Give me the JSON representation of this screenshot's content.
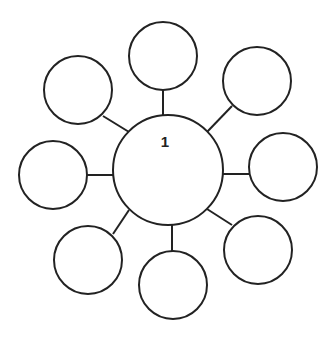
{
  "diagram": {
    "type": "bubble-map",
    "stroke_color": "#222222",
    "background": "#ffffff",
    "center_node": {
      "label": "1",
      "cx": 168,
      "cy": 170,
      "r": 55,
      "label_x": 165,
      "label_y": 147
    },
    "outer_nodes": [
      {
        "id": "top",
        "label": "",
        "cx": 163,
        "cy": 56,
        "r": 34,
        "line": [
          163,
          90,
          163,
          115
        ]
      },
      {
        "id": "top-right",
        "label": "",
        "cx": 257,
        "cy": 81,
        "r": 34,
        "line": [
          232,
          106,
          207,
          132
        ]
      },
      {
        "id": "right",
        "label": "",
        "cx": 283,
        "cy": 167,
        "r": 34,
        "line": [
          249,
          174,
          223,
          174
        ]
      },
      {
        "id": "bottom-right",
        "label": "",
        "cx": 258,
        "cy": 250,
        "r": 34,
        "line": [
          232,
          225,
          207,
          209
        ]
      },
      {
        "id": "bottom",
        "label": "",
        "cx": 173,
        "cy": 285,
        "r": 34,
        "line": [
          172,
          251,
          172,
          225
        ]
      },
      {
        "id": "bottom-left",
        "label": "",
        "cx": 88,
        "cy": 260,
        "r": 34,
        "line": [
          113,
          234,
          129,
          210
        ]
      },
      {
        "id": "left",
        "label": "",
        "cx": 53,
        "cy": 175,
        "r": 34,
        "line": [
          87,
          175,
          113,
          175
        ]
      },
      {
        "id": "top-left",
        "label": "",
        "cx": 78,
        "cy": 90,
        "r": 34,
        "line": [
          103,
          116,
          129,
          132
        ]
      }
    ]
  }
}
